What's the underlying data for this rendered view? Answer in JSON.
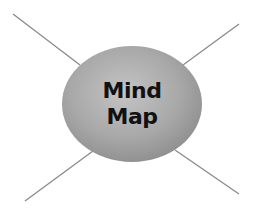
{
  "diagram": {
    "type": "mind-map",
    "center_node": {
      "lines": [
        "Mind",
        "Map"
      ],
      "shape": "ellipse",
      "fill_light": "#bdbdbd",
      "fill_dark": "#8f8f8f",
      "text_color": "#111111"
    },
    "branches": [
      {
        "name": "top-left",
        "label": ""
      },
      {
        "name": "top-right",
        "label": ""
      },
      {
        "name": "bottom-left",
        "label": ""
      },
      {
        "name": "bottom-right",
        "label": ""
      }
    ],
    "line_color": "#8a8a8a"
  }
}
